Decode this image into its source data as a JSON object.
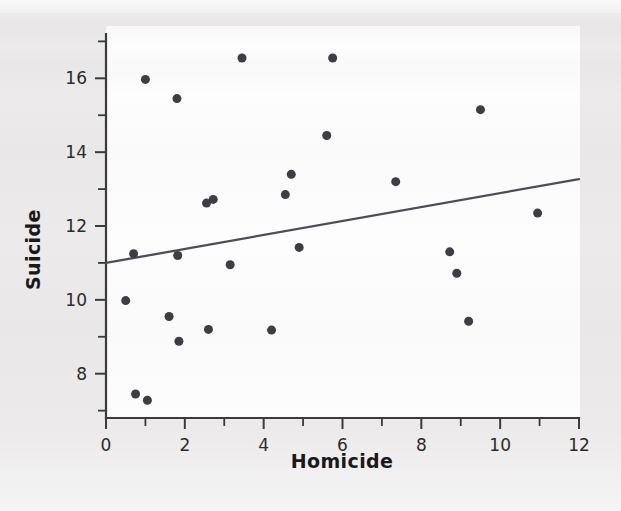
{
  "chart_data": {
    "type": "scatter",
    "title": "",
    "xlabel": "Homicide",
    "ylabel": "Suicide",
    "xlim": [
      0,
      12
    ],
    "ylim": [
      6.8,
      17.2
    ],
    "xticks": [
      0,
      2,
      4,
      6,
      8,
      10,
      12
    ],
    "xtick_labels": [
      "0",
      "2",
      "4",
      "6",
      "8",
      "10",
      "12"
    ],
    "xminor_ticks": [
      1,
      3,
      5,
      7,
      9,
      11
    ],
    "yticks": [
      8,
      10,
      12,
      14,
      16
    ],
    "ytick_labels": [
      "8",
      "10",
      "12",
      "14",
      "16"
    ],
    "yminor_ticks": [
      7,
      9,
      11,
      13,
      15,
      17
    ],
    "grid": false,
    "legend": "none",
    "marker_color": "#3d3d44",
    "marker_size": 9,
    "points": [
      {
        "x": 0.5,
        "y": 9.98
      },
      {
        "x": 0.7,
        "y": 11.25
      },
      {
        "x": 0.75,
        "y": 7.45
      },
      {
        "x": 1.0,
        "y": 15.97
      },
      {
        "x": 1.05,
        "y": 7.28
      },
      {
        "x": 1.6,
        "y": 9.55
      },
      {
        "x": 1.8,
        "y": 15.45
      },
      {
        "x": 1.82,
        "y": 11.2
      },
      {
        "x": 1.85,
        "y": 8.88
      },
      {
        "x": 2.55,
        "y": 12.62
      },
      {
        "x": 2.6,
        "y": 9.2
      },
      {
        "x": 2.72,
        "y": 12.72
      },
      {
        "x": 3.15,
        "y": 10.95
      },
      {
        "x": 3.45,
        "y": 16.55
      },
      {
        "x": 4.2,
        "y": 9.18
      },
      {
        "x": 4.55,
        "y": 12.85
      },
      {
        "x": 4.7,
        "y": 13.4
      },
      {
        "x": 4.9,
        "y": 11.42
      },
      {
        "x": 5.6,
        "y": 14.45
      },
      {
        "x": 5.75,
        "y": 16.55
      },
      {
        "x": 7.35,
        "y": 13.2
      },
      {
        "x": 8.72,
        "y": 11.3
      },
      {
        "x": 8.9,
        "y": 10.72
      },
      {
        "x": 9.2,
        "y": 9.42
      },
      {
        "x": 9.5,
        "y": 15.15
      },
      {
        "x": 10.95,
        "y": 12.35
      }
    ],
    "trendline": {
      "type": "linear-fit",
      "x_start": 0,
      "y_start": 11.0,
      "x_end": 12,
      "y_end": 13.27,
      "color": "#4d4d55"
    }
  }
}
